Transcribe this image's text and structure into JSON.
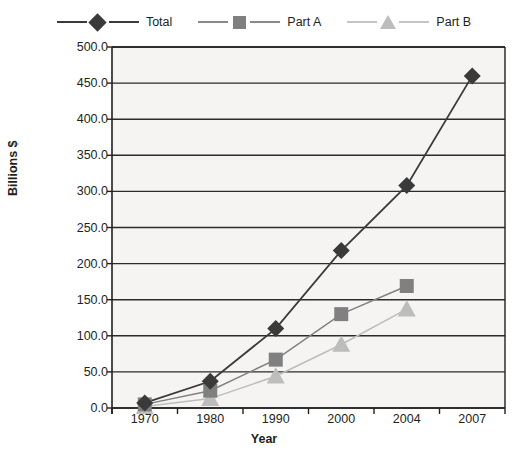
{
  "chart_data": {
    "type": "line",
    "title": "",
    "xlabel": "Year",
    "ylabel": "Billions $",
    "categories": [
      "1970",
      "1980",
      "1990",
      "2000",
      "2004",
      "2007"
    ],
    "ylim": [
      0,
      500
    ],
    "ytick_step": 50,
    "ytick_labels": [
      "0.0",
      "50.0",
      "100.0",
      "150.0",
      "200.0",
      "250.0",
      "300.0",
      "350.0",
      "400.0",
      "450.0",
      "500.0"
    ],
    "grid": true,
    "legend_position": "top",
    "series": [
      {
        "name": "Total",
        "marker": "diamond",
        "color": "#3a3a3a",
        "values": [
          7,
          37,
          110,
          218,
          308,
          460
        ]
      },
      {
        "name": "Part A",
        "marker": "square",
        "color": "#808080",
        "values": [
          5,
          24,
          67,
          130,
          169,
          null
        ]
      },
      {
        "name": "Part B",
        "marker": "triangle",
        "color": "#bdbdbd",
        "values": [
          2,
          13,
          44,
          88,
          137,
          null
        ]
      }
    ]
  },
  "legend": {
    "entries": [
      {
        "label": "Total"
      },
      {
        "label": "Part A"
      },
      {
        "label": "Part B"
      }
    ]
  },
  "axes": {
    "y_title": "Billions $",
    "x_title": "Year",
    "y_ticks": [
      "500.0",
      "450.0",
      "400.0",
      "350.0",
      "300.0",
      "250.0",
      "200.0",
      "150.0",
      "100.0",
      "50.0",
      "0.0"
    ],
    "x_ticks": [
      "1970",
      "1980",
      "1990",
      "2000",
      "2004",
      "2007"
    ]
  },
  "colors": {
    "total": "#3a3a3a",
    "part_a": "#808080",
    "part_b": "#bdbdbd",
    "plot_bg": "#f5f4f2",
    "axis": "#231f20",
    "grid": "#2d2a28"
  }
}
